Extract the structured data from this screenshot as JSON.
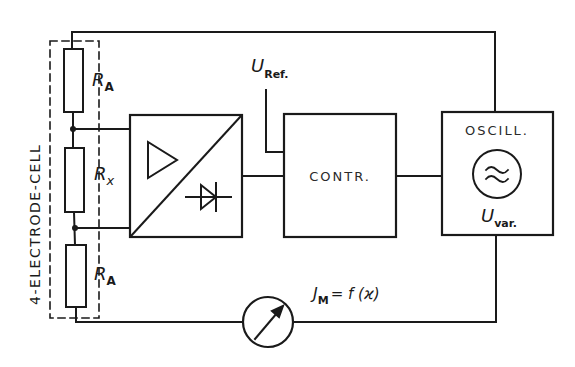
{
  "cell": {
    "label": "4-ELECTRODE-CELL",
    "resistors": [
      {
        "symbol": "R",
        "sub": "A"
      },
      {
        "symbol": "R",
        "sub": "x"
      },
      {
        "symbol": "R",
        "sub": "A"
      }
    ]
  },
  "blocks": {
    "converter": {
      "name": "amplifier-rectifier"
    },
    "controller": {
      "label": "CONTR."
    },
    "oscillator": {
      "label": "OSCILL.",
      "out_symbol": "U",
      "out_sub": "var."
    }
  },
  "reference": {
    "symbol": "U",
    "sub": "Ref."
  },
  "meter": {
    "eq_symbol": "J",
    "eq_sub": "M",
    "eq_rest": "= f (ϰ)"
  },
  "colors": {
    "ink": "#1a1a1a",
    "background": "#ffffff"
  }
}
